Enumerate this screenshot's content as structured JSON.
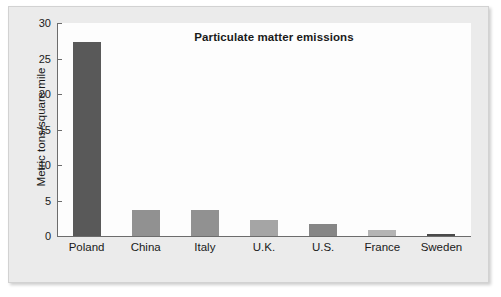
{
  "chart_data": {
    "type": "bar",
    "title": "Particulate matter emissions",
    "xlabel": "",
    "ylabel": "Metric tons/square mile",
    "categories": [
      "Poland",
      "China",
      "Italy",
      "U.K.",
      "U.S.",
      "France",
      "Sweden"
    ],
    "values": [
      27.3,
      3.7,
      3.6,
      2.2,
      1.7,
      0.8,
      0.3
    ],
    "bar_colors": [
      "#595959",
      "#919191",
      "#919191",
      "#a5a5a5",
      "#868686",
      "#b4b4b4",
      "#4a4a4a"
    ],
    "ylim": [
      0,
      30
    ],
    "yticks": [
      0,
      5,
      10,
      15,
      20,
      25,
      30
    ],
    "ytick_labels": [
      "0",
      "5",
      "10",
      "15",
      "20",
      "25",
      "30"
    ],
    "grid": false,
    "legend": null,
    "legend_position": "none",
    "series": [
      {
        "name": "Particulate matter emissions",
        "values": [
          27.3,
          3.7,
          3.6,
          2.2,
          1.7,
          0.8,
          0.3
        ]
      }
    ]
  },
  "figure": {
    "background_color": "#ebebeb",
    "plot_background_color": "#fdfdfd",
    "axis_color": "#6c6c6c",
    "text_color": "#1a1a1a"
  }
}
